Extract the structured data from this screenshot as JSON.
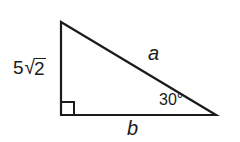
{
  "figure": {
    "kind": "right-triangle-diagram",
    "background_color": "#ffffff",
    "stroke_color": "#1b1b1b",
    "text_color": "#1b1b1b",
    "stroke_width": 2.2,
    "vertices": {
      "apex": {
        "x": 61,
        "y": 22
      },
      "right_angle": {
        "x": 61,
        "y": 115
      },
      "base_right": {
        "x": 216,
        "y": 115
      }
    },
    "right_angle_marker": {
      "size": 13,
      "present": true
    }
  },
  "labels": {
    "vertical_leg": {
      "coefficient": "5",
      "radical_sign": "√",
      "radicand": "2",
      "full_text": "5√2"
    },
    "hypotenuse": "a",
    "horizontal_leg": "b",
    "angle": "30°"
  },
  "chart_data": {
    "type": "diagram",
    "title": "",
    "shape": "right triangle",
    "sides": [
      {
        "name": "vertical leg",
        "label": "5√2",
        "from": "apex",
        "to": "right_angle"
      },
      {
        "name": "hypotenuse",
        "label": "a",
        "from": "apex",
        "to": "base_right"
      },
      {
        "name": "horizontal leg",
        "label": "b",
        "from": "right_angle",
        "to": "base_right"
      }
    ],
    "angles": [
      {
        "at": "right_angle",
        "label": "",
        "value": 90,
        "marker": "square"
      },
      {
        "at": "base_right",
        "label": "30°",
        "value": 30,
        "marker": "none"
      }
    ]
  }
}
